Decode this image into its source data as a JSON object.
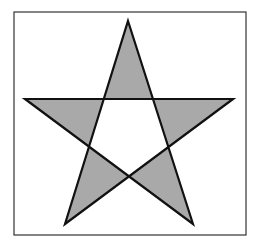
{
  "figure": {
    "shape": "pentagram",
    "frame": {
      "x": 14,
      "y": 12,
      "width": 232,
      "height": 223,
      "stroke": "#333333",
      "stroke_width": 1.2
    },
    "star": {
      "points": [
        [
          128,
          21
        ],
        [
          193,
          224
        ],
        [
          25,
          99
        ],
        [
          233,
          99
        ],
        [
          65,
          224
        ]
      ],
      "fill": "#a9a9a9",
      "stroke": "#111111",
      "stroke_width": 2.2,
      "fill_rule": "evenodd"
    }
  }
}
